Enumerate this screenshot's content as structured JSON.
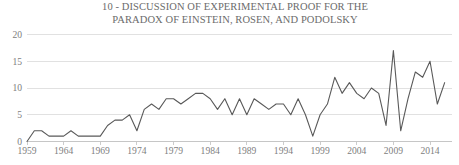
{
  "chart_data": {
    "type": "line",
    "title": "10 - DISCUSSION OF EXPERIMENTAL PROOF FOR THE\nPARADOX OF EINSTEIN, ROSEN, AND PODOLSKY",
    "xlabel": "",
    "ylabel": "",
    "ylim": [
      0,
      20
    ],
    "xlim": [
      1959,
      2017
    ],
    "grid": true,
    "legend": null,
    "yticks": [
      0,
      5,
      10,
      15,
      20
    ],
    "ytick_labels": [
      "0",
      "5",
      "10",
      "15",
      "20"
    ],
    "xticks": [
      1959,
      1964,
      1969,
      1974,
      1979,
      1984,
      1989,
      1994,
      1999,
      2004,
      2009,
      2014
    ],
    "xtick_labels": [
      "1959",
      "1964",
      "1969",
      "1974",
      "1979",
      "1984",
      "1989",
      "1994",
      "1999",
      "2004",
      "2009",
      "2014"
    ],
    "series": [
      {
        "name": "Publications per year",
        "color": "#595959",
        "x": [
          1959,
          1960,
          1961,
          1962,
          1963,
          1964,
          1965,
          1966,
          1967,
          1968,
          1969,
          1970,
          1971,
          1972,
          1973,
          1974,
          1975,
          1976,
          1977,
          1978,
          1979,
          1980,
          1981,
          1982,
          1983,
          1984,
          1985,
          1986,
          1987,
          1988,
          1989,
          1990,
          1991,
          1992,
          1993,
          1994,
          1995,
          1996,
          1997,
          1998,
          1999,
          2000,
          2001,
          2002,
          2003,
          2004,
          2005,
          2006,
          2007,
          2008,
          2009,
          2010,
          2011,
          2012,
          2013,
          2014,
          2015,
          2016
        ],
        "values": [
          0,
          2,
          2,
          1,
          1,
          1,
          2,
          1,
          1,
          1,
          1,
          3,
          4,
          4,
          5,
          2,
          6,
          7,
          6,
          8,
          8,
          7,
          8,
          9,
          9,
          8,
          6,
          8,
          5,
          8,
          5,
          8,
          7,
          6,
          7,
          7,
          5,
          8,
          5,
          1,
          5,
          7,
          12,
          9,
          11,
          9,
          8,
          10,
          9,
          3,
          17,
          2,
          8,
          13,
          12,
          15,
          7,
          11
        ]
      }
    ]
  },
  "axis_colors": {
    "grid": "#d9d9d9",
    "axis": "#bfbfbf",
    "text": "#808080",
    "title": "#6b6b6b",
    "line": "#595959"
  }
}
